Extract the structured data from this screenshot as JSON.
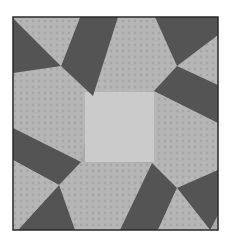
{
  "image": {
    "subject": "quilt-block",
    "description": "Grayscale pinwheel-style quilt block with light center square, four patterned kite patches and eight dark triangular wedges",
    "colors": {
      "background": "#ffffff",
      "border": "#2a2a2a",
      "dark": "#545454",
      "medium": "#a9a9a9",
      "light": "#bdbdbd",
      "center": "#cbcbcb"
    },
    "block_bounds": {
      "x": 13,
      "y": 17,
      "width": 205,
      "height": 213
    }
  }
}
